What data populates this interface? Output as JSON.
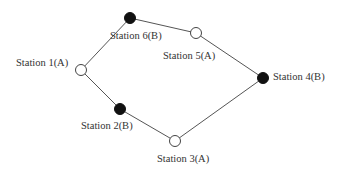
{
  "diagram": {
    "type": "ring-network",
    "colors": {
      "line": "#555555",
      "filled_node": "#111111",
      "hollow_node_fill": "#ffffff",
      "hollow_node_stroke": "#444444",
      "text": "#333333"
    },
    "nodes": [
      {
        "id": "s1",
        "label": "Station 1(A)",
        "type": "A",
        "style": "hollow",
        "x": 81,
        "y": 70,
        "label_x": 16,
        "label_y": 58
      },
      {
        "id": "s6",
        "label": "Station 6(B)",
        "type": "B",
        "style": "filled",
        "x": 130,
        "y": 18,
        "label_x": 110,
        "label_y": 31
      },
      {
        "id": "s5",
        "label": "Station 5(A)",
        "type": "A",
        "style": "hollow",
        "x": 196,
        "y": 33,
        "label_x": 163,
        "label_y": 51
      },
      {
        "id": "s4",
        "label": "Station 4(B)",
        "type": "B",
        "style": "filled",
        "x": 263,
        "y": 78,
        "label_x": 273,
        "label_y": 72
      },
      {
        "id": "s3",
        "label": "Station 3(A)",
        "type": "A",
        "style": "hollow",
        "x": 175,
        "y": 141,
        "label_x": 157,
        "label_y": 154
      },
      {
        "id": "s2",
        "label": "Station 2(B)",
        "type": "B",
        "style": "filled",
        "x": 120,
        "y": 109,
        "label_x": 81,
        "label_y": 121
      }
    ],
    "edges": [
      [
        "s1",
        "s6"
      ],
      [
        "s6",
        "s5"
      ],
      [
        "s5",
        "s4"
      ],
      [
        "s4",
        "s3"
      ],
      [
        "s3",
        "s2"
      ],
      [
        "s2",
        "s1"
      ]
    ]
  }
}
